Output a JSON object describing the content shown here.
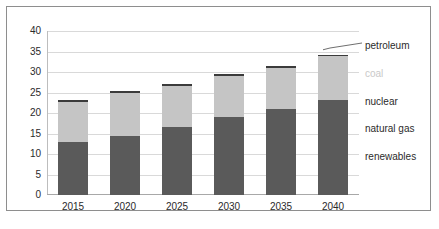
{
  "chart_data": {
    "type": "bar",
    "stacked": true,
    "title": "",
    "subtitle": "",
    "xlabel": "",
    "ylabel": "",
    "ylim": [
      0,
      40
    ],
    "ytick_step": 5,
    "ytick_labels": [
      "40",
      "35",
      "30",
      "25",
      "20",
      "15",
      "10",
      "5",
      "0"
    ],
    "grid": true,
    "legend_position": "right",
    "categories": [
      "2015",
      "2020",
      "2025",
      "2030",
      "2035",
      "2040"
    ],
    "series": [
      {
        "name": "renewables",
        "color": "#5a5a5a",
        "values": [
          4.4,
          4.9,
          5.7,
          6.5,
          7.2,
          7.9
        ]
      },
      {
        "name": "natural gas",
        "color": "#5a5a5a",
        "values": [
          4.4,
          4.9,
          5.6,
          6.4,
          7.1,
          7.8
        ]
      },
      {
        "name": "nuclear",
        "color": "#5a5a5a",
        "values": [
          4.2,
          4.7,
          5.4,
          6.1,
          6.7,
          7.4
        ]
      },
      {
        "name": "coal",
        "color": "#c5c5c5",
        "values": [
          9.7,
          10.4,
          10.0,
          10.0,
          10.0,
          10.7
        ]
      },
      {
        "name": "petroleum",
        "color": "#3b3b3b",
        "values": [
          0.4,
          0.4,
          0.4,
          0.4,
          0.4,
          0.4
        ]
      }
    ],
    "totals": [
      23.1,
      25.3,
      27.1,
      29.4,
      31.4,
      34.2
    ],
    "annotations": [
      {
        "text": "petroleum",
        "target": "2040-top-segment",
        "leader_line": true
      }
    ]
  },
  "legend": {
    "items": [
      {
        "label": "petroleum",
        "faded": false
      },
      {
        "label": "coal",
        "faded": true
      },
      {
        "label": "nuclear",
        "faded": false
      },
      {
        "label": "natural gas",
        "faded": false
      },
      {
        "label": "renewables",
        "faded": false
      }
    ]
  }
}
